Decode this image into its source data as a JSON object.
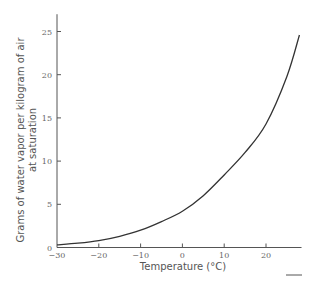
{
  "chart_data": {
    "type": "line",
    "title": "",
    "xlabel": "Temperature (°C)",
    "ylabel_lines": [
      "Grams of water vapor per kilogram of air",
      "at saturation"
    ],
    "ylabel": "Grams of water vapor per kilogram of air at saturation",
    "xlim": [
      -30,
      28.5
    ],
    "ylim": [
      0,
      27
    ],
    "x_ticks": [
      -30,
      -20,
      -10,
      0,
      10,
      20
    ],
    "y_ticks": [
      0,
      5,
      10,
      15,
      20,
      25
    ],
    "grid": false,
    "legend": null,
    "series": [
      {
        "name": "Saturation mixing ratio",
        "x": [
          -30,
          -25,
          -20,
          -15,
          -10,
          -5,
          0,
          5,
          10,
          15,
          20,
          25,
          28
        ],
        "values": [
          0.3,
          0.5,
          0.8,
          1.3,
          2.0,
          3.0,
          4.2,
          6.0,
          8.4,
          11.0,
          14.3,
          19.8,
          24.6
        ]
      }
    ]
  }
}
